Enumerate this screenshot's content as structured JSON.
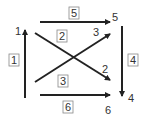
{
  "diagram": {
    "arrows": [
      {
        "id": "1",
        "box_label": "1",
        "end_label": "1",
        "direction": "up"
      },
      {
        "id": "2",
        "box_label": "2",
        "end_label": "2",
        "direction": "down-right"
      },
      {
        "id": "3",
        "box_label": "3",
        "end_label": "3",
        "direction": "up-right"
      },
      {
        "id": "4",
        "box_label": "4",
        "end_label": "4",
        "direction": "down"
      },
      {
        "id": "5",
        "box_label": "5",
        "end_label": "5",
        "direction": "right"
      },
      {
        "id": "6",
        "box_label": "6",
        "end_label": "6",
        "direction": "right"
      }
    ],
    "colors": {
      "line": "#222222",
      "text": "#333333",
      "box_border": "#888888"
    }
  }
}
